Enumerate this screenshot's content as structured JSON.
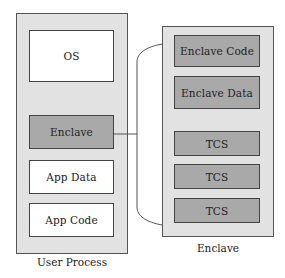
{
  "diagram": {
    "user_process": {
      "caption": "User Process",
      "segments": [
        {
          "label": "OS",
          "style": "white"
        },
        {
          "label": "Enclave",
          "style": "gray"
        },
        {
          "label": "App Data",
          "style": "white"
        },
        {
          "label": "App Code",
          "style": "white"
        }
      ]
    },
    "enclave": {
      "caption": "Enclave",
      "segments": [
        {
          "label": "Enclave Code",
          "style": "gray"
        },
        {
          "label": "Enclave Data",
          "style": "gray"
        },
        {
          "label": "TCS",
          "style": "gray"
        },
        {
          "label": "TCS",
          "style": "gray"
        },
        {
          "label": "TCS",
          "style": "gray"
        }
      ]
    },
    "colors": {
      "container_fill": "#e2e2e2",
      "gray_block": "#a9a9a9",
      "white_block": "#ffffff",
      "stroke": "#444444"
    },
    "connector": {
      "from": "user_process.Enclave",
      "to": "enclave",
      "kind": "bracket"
    }
  }
}
